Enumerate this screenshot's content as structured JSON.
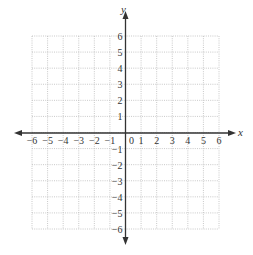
{
  "diagram": {
    "type": "coordinate-grid",
    "x_axis": {
      "label": "x",
      "min": -6,
      "max": 6,
      "ticks": [
        "−6",
        "−5",
        "−4",
        "−3",
        "−2",
        "−1",
        "0",
        "1",
        "2",
        "3",
        "4",
        "5",
        "6"
      ]
    },
    "y_axis": {
      "label": "y",
      "min": -6,
      "max": 6,
      "ticks_positive": [
        "1",
        "2",
        "3",
        "4",
        "5",
        "6"
      ],
      "ticks_negative": [
        "−1",
        "−2",
        "−3",
        "−4",
        "−5",
        "−6"
      ]
    },
    "colors": {
      "axis": "#333333",
      "grid": "#bbbbbb",
      "grid_dotted": "#999999"
    }
  }
}
